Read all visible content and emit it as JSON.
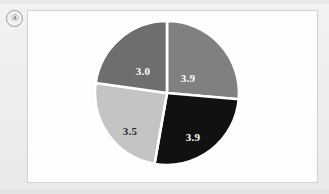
{
  "figure": {
    "marker_label": "④",
    "frame": {
      "background_color": "#fdfdfd",
      "border_color": "#d2d2d2"
    },
    "page_background_color": "#efefef"
  },
  "chart_data": {
    "type": "pie",
    "title": "",
    "subtitle": "",
    "xlabel": "",
    "ylabel": "",
    "grid": false,
    "legend": "none",
    "start_angle_deg": 0,
    "direction": "clockwise",
    "separator_color": "#ffffff",
    "total": 14.3,
    "categories": [
      "3.9 (upper right)",
      "3.9 (lower right)",
      "3.5 (lower left)",
      "3.0 (upper left)"
    ],
    "values": [
      3.9,
      3.9,
      3.5,
      3.0
    ],
    "labels": [
      "3.9",
      "3.9",
      "3.5",
      "3.0"
    ],
    "colors": [
      "#808080",
      "#111111",
      "#c4c4c4",
      "#6e6e6e"
    ],
    "label_colors": [
      "#ffffff",
      "#ffffff",
      "#2b2b2b",
      "#ffffff"
    ],
    "slices": [
      {
        "label": "3.9",
        "value": 3.9,
        "color": "#808080",
        "label_color": "#ffffff",
        "start_deg": 0,
        "end_deg": 95,
        "label_x": 96,
        "label_y": 62
      },
      {
        "label": "3.9",
        "value": 3.9,
        "color": "#111111",
        "label_color": "#ffffff",
        "start_deg": 95,
        "end_deg": 190,
        "label_x": 101,
        "label_y": 121
      },
      {
        "label": "3.5",
        "value": 3.5,
        "color": "#c4c4c4",
        "label_color": "#2b2b2b",
        "start_deg": 190,
        "end_deg": 278,
        "label_x": 38,
        "label_y": 115
      },
      {
        "label": "3.0",
        "value": 3.0,
        "color": "#6e6e6e",
        "label_color": "#ffffff",
        "start_deg": 278,
        "end_deg": 360,
        "label_x": 51,
        "label_y": 55
      }
    ]
  }
}
